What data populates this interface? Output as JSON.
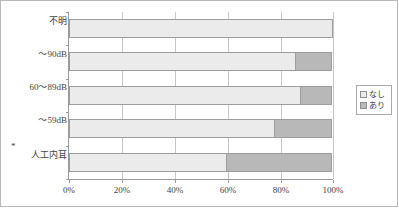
{
  "chart_data": {
    "type": "bar",
    "orientation": "horizontal",
    "stacked": true,
    "normalized_percent": true,
    "title": "",
    "xlabel": "",
    "ylabel": "",
    "xlim": [
      0,
      100
    ],
    "xticks": [
      0,
      20,
      40,
      60,
      80,
      100
    ],
    "xtick_labels": [
      "0%",
      "20%",
      "40%",
      "60%",
      "80%",
      "100%"
    ],
    "grid": "vertical",
    "legend_position": "right",
    "categories": [
      "不明",
      "～90dB",
      "60～89dB",
      "～59dB",
      "人工内耳"
    ],
    "category_notes": [
      "",
      "",
      "",
      "",
      "*"
    ],
    "series": [
      {
        "name": "なし",
        "values": [
          100,
          86,
          88,
          78,
          60
        ],
        "color": "#ebebeb"
      },
      {
        "name": "あり",
        "values": [
          0,
          14,
          12,
          22,
          40
        ],
        "color": "#b8b8b8"
      }
    ]
  },
  "legend": {
    "items": [
      {
        "label": "なし"
      },
      {
        "label": "あり"
      }
    ]
  },
  "colors": {
    "nashi": "#ebebeb",
    "ari": "#b8b8b8",
    "axis": "#9a9a9a",
    "grid": "#c6c6c6",
    "frame": "#b9b9b9",
    "text": "#3a3a3a"
  }
}
